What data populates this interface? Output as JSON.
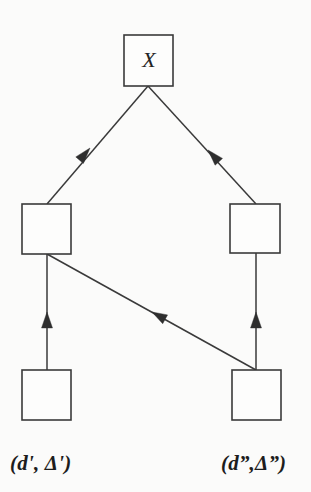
{
  "figure": {
    "background_color": "#fbfbfa",
    "line_color": "#3a3a3a",
    "arrow_color": "#2e2e2e",
    "text_color": "#1d1d1d"
  },
  "nodes": {
    "root": {
      "label": "X",
      "x": 124,
      "y": 35,
      "width": 49,
      "height": 51
    },
    "middle_left": {
      "label": "",
      "x": 22,
      "y": 204,
      "width": 49,
      "height": 50
    },
    "middle_right": {
      "label": "",
      "x": 230,
      "y": 204,
      "width": 50,
      "height": 49
    },
    "bottom_left": {
      "label": "",
      "x": 22,
      "y": 370,
      "width": 49,
      "height": 50
    },
    "bottom_right": {
      "label": "",
      "x": 232,
      "y": 370,
      "width": 49,
      "height": 50
    }
  },
  "edges": [
    {
      "name": "root-to-middle-left",
      "x1": 148,
      "y1": 86,
      "x2": 47,
      "y2": 204
    },
    {
      "name": "root-to-middle-right",
      "x1": 148,
      "y1": 86,
      "x2": 256,
      "y2": 204
    },
    {
      "name": "middle-left-to-bottom-left",
      "x1": 47,
      "y1": 254,
      "x2": 47,
      "y2": 370
    },
    {
      "name": "middle-right-to-bottom-right",
      "x1": 256,
      "y1": 253,
      "x2": 256,
      "y2": 370
    },
    {
      "name": "middle-left-to-bottom-right",
      "x1": 47,
      "y1": 254,
      "x2": 256,
      "y2": 370
    }
  ],
  "captions": {
    "left": "(d',  Δ')",
    "right": "(d”,Δ”)"
  }
}
